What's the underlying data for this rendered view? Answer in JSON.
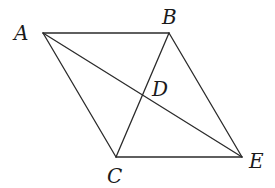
{
  "diagram": {
    "type": "geometry",
    "points": {
      "A": {
        "label": "A",
        "x": 43,
        "y": 33,
        "label_x": 14,
        "label_y": 40
      },
      "B": {
        "label": "B",
        "x": 169,
        "y": 33,
        "label_x": 162,
        "label_y": 24
      },
      "C": {
        "label": "C",
        "x": 116,
        "y": 157,
        "label_x": 107,
        "label_y": 183
      },
      "D": {
        "label": "D",
        "x": 143,
        "y": 95,
        "label_x": 152,
        "label_y": 96
      },
      "E": {
        "label": "E",
        "x": 242,
        "y": 157,
        "label_x": 249,
        "label_y": 168
      }
    },
    "segments": [
      {
        "from": "A",
        "to": "B"
      },
      {
        "from": "B",
        "to": "E"
      },
      {
        "from": "C",
        "to": "E"
      },
      {
        "from": "A",
        "to": "C"
      },
      {
        "from": "A",
        "to": "E"
      },
      {
        "from": "B",
        "to": "C"
      }
    ],
    "colors": {
      "stroke": "#2b2b2b",
      "label": "#1a1a1a",
      "background": "#ffffff"
    }
  }
}
